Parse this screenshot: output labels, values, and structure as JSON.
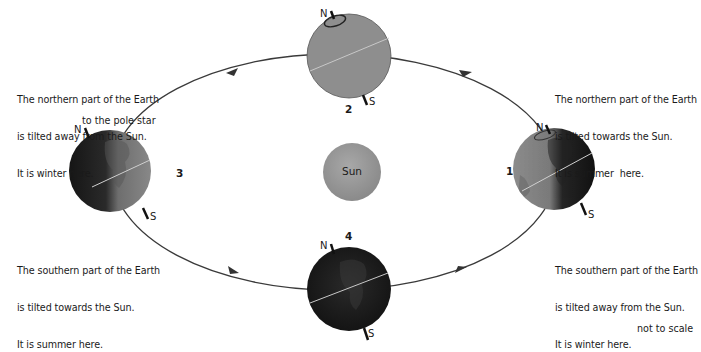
{
  "diagram": {
    "sun": {
      "label": "Sun",
      "color": "#9a9a9a"
    },
    "positions": [
      {
        "id": "1",
        "label": "1",
        "north": "N",
        "south": "S",
        "shade": "lit-left"
      },
      {
        "id": "2",
        "label": "2",
        "north": "N",
        "south": "S",
        "shade": "fully-lit"
      },
      {
        "id": "3",
        "label": "3",
        "north": "N",
        "south": "S",
        "shade": "lit-right"
      },
      {
        "id": "4",
        "label": "4",
        "north": "N",
        "south": "S",
        "shade": "dark"
      }
    ],
    "captions": {
      "top_left": [
        "The northern part of the Earth",
        "is tilted away from the Sun.",
        "It is winter here."
      ],
      "top_right": [
        "The northern part of the Earth",
        "is tilted towards the Sun.",
        "It is summer  here."
      ],
      "bottom_left": [
        "The southern part of the Earth",
        "is tilted towards the Sun.",
        "It is summer here."
      ],
      "bottom_right": [
        "The southern part of the Earth",
        "is tilted away from the Sun.",
        "It is winter here."
      ]
    },
    "pole_star_label": "to the pole star",
    "scale_note": "not to scale",
    "orbit_direction": "anticlockwise",
    "colors": {
      "orbit": "#3a3a3a",
      "earth_light": "#8e8e8e",
      "earth_dark": "#1c1c1c"
    }
  }
}
